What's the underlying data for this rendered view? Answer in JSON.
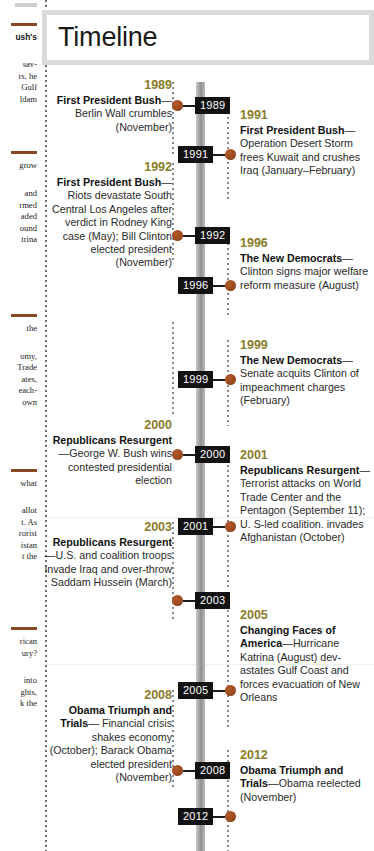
{
  "page": {
    "title": "Timeline",
    "colors": {
      "year_heading": "#8a7b28",
      "marker_tag_bg": "#121212",
      "marker_dot": "#9c4a1e",
      "spine": "#8f8f8f",
      "title_frame": "#d9d9d9",
      "rule_accent": "#8a4726"
    }
  },
  "left_margin_fragments": [
    {
      "id": "f1",
      "text": "ush's",
      "style": "serif"
    },
    {
      "id": "f2",
      "text": "sav-"
    },
    {
      "id": "f3",
      "text": "rs, he"
    },
    {
      "id": "f4",
      "text": "Gulf"
    },
    {
      "id": "f5",
      "text": "ldam"
    },
    {
      "id": "f6",
      "text": "grow"
    },
    {
      "id": "f7",
      "text": "and"
    },
    {
      "id": "f8",
      "text": "rmed"
    },
    {
      "id": "f9",
      "text": "aded"
    },
    {
      "id": "f10",
      "text": "ound"
    },
    {
      "id": "f11",
      "text": "trina"
    },
    {
      "id": "f12",
      "text": "the"
    },
    {
      "id": "f13",
      "text": "omy,"
    },
    {
      "id": "f14",
      "text": "Trade"
    },
    {
      "id": "f15",
      "text": "ates,"
    },
    {
      "id": "f16",
      "text": "each-"
    },
    {
      "id": "f17",
      "text": "own"
    },
    {
      "id": "f18",
      "text": "what"
    },
    {
      "id": "f19",
      "text": "allot"
    },
    {
      "id": "f20",
      "text": "t. As"
    },
    {
      "id": "f21",
      "text": "rorist"
    },
    {
      "id": "f22",
      "text": "istan"
    },
    {
      "id": "f23",
      "text": "t the"
    },
    {
      "id": "f24",
      "text": "rican"
    },
    {
      "id": "f25",
      "text": "ury?"
    },
    {
      "id": "f26",
      "text": "into"
    },
    {
      "id": "f27",
      "text": "ghts,"
    },
    {
      "id": "f28",
      "text": "k the"
    }
  ],
  "timeline": {
    "entries": [
      {
        "id": "e1989",
        "side": "left",
        "year": "1989",
        "marker_label": "1989",
        "heading": "First President Bush",
        "dash": "—",
        "text": "Berlin Wall crumbles (November)"
      },
      {
        "id": "e1991",
        "side": "right",
        "year": "1991",
        "marker_label": "1991",
        "heading": "First President Bush",
        "dash": "—",
        "text": "Operation Desert Storm frees Kuwait and crushes Iraq (January–February)"
      },
      {
        "id": "e1992",
        "side": "left",
        "year": "1992",
        "marker_label": "1992",
        "heading": "First President Bush",
        "dash": "—",
        "text": "Riots devastate South Central Los Angeles after verdict in Rodney King case (May); Bill Clinton elected president (November)"
      },
      {
        "id": "e1996",
        "side": "right",
        "year": "1996",
        "marker_label": "1996",
        "heading": "The New Democrats",
        "dash": "—",
        "text": "Clinton signs major welfare reform measure (August)"
      },
      {
        "id": "e1999",
        "side": "right",
        "year": "1999",
        "marker_label": "1999",
        "heading": "The New Democrats",
        "dash": "—",
        "text": "Senate acquits Clinton of impeachment charges (February)"
      },
      {
        "id": "e2000",
        "side": "left",
        "year": "2000",
        "marker_label": "2000",
        "heading": "Republicans Resurgent",
        "dash": "—",
        "text": "George W. Bush wins contested presidential election"
      },
      {
        "id": "e2001",
        "side": "right",
        "year": "2001",
        "marker_label": "2001",
        "heading": "Republicans Resurgent",
        "dash": "—",
        "text": "Terrorist attacks on World Trade Center and the Pentagon (September 11); U. S-led coalition. invades Afghanistan (October)"
      },
      {
        "id": "e2003",
        "side": "left",
        "year": "2003",
        "marker_label": "2003",
        "heading": "Republicans Resurgent",
        "dash": "—",
        "text": "U.S. and coalition troops invade Iraq and over-throw Saddam Hussein (March)"
      },
      {
        "id": "e2005",
        "side": "right",
        "year": "2005",
        "marker_label": "2005",
        "heading": "Changing Faces of America",
        "dash": "—",
        "text": "Hurricane Katrina (August) dev-astates Gulf Coast and forces evacuation of New Orleans"
      },
      {
        "id": "e2008",
        "side": "left",
        "year": "2008",
        "marker_label": "2008",
        "heading": "Obama Triumph and Trials",
        "dash": "— ",
        "text": "Financial crisis shakes economy (October); Barack Obama elected president (November)"
      },
      {
        "id": "e2012",
        "side": "right",
        "year": "2012",
        "marker_label": "2012",
        "heading": "Obama Triumph and Trials",
        "dash": "—",
        "text": "Obama reelected (November)"
      }
    ]
  }
}
